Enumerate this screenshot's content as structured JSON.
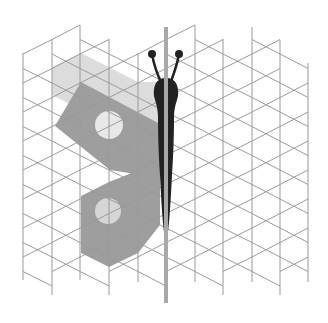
{
  "figure": {
    "title": "Butterfly on triangular grid with mirror line",
    "width": 328,
    "height": 323
  },
  "grid": {
    "columns_x": [
      23,
      52,
      80,
      109,
      138,
      166,
      195,
      223,
      252,
      280,
      308
    ],
    "row_step": 29,
    "stroke": "#9a9a9a"
  },
  "colors": {
    "background": "#ffffff",
    "wing_light": "#dcdcdc",
    "wing_dark": "#9e9e9e",
    "spot": "#e8e8e8",
    "body": "#222222",
    "mirror_line": "#a8a8a8"
  },
  "shapes": {
    "upper_wing_light": "52,67 81,53 138,82 160,82 160,150 52,95",
    "upper_wing_dark": "81,82 160,124 160,178 110,170 55,126",
    "lower_wing": "81,196 109,182 140,170 160,170 160,225 138,253 109,267 81,253",
    "upper_spot": {
      "cx": 109,
      "cy": 125,
      "r": 14
    },
    "lower_spot": {
      "cx": 108,
      "cy": 211,
      "r": 13
    }
  },
  "mirror_line": {
    "x": 166,
    "y1": 27,
    "y2": 303
  },
  "body": {
    "head": {
      "cx": 166,
      "cy": 90,
      "rx": 12,
      "ry": 12
    },
    "antenna_left_tip": {
      "cx": 152,
      "cy": 54,
      "r": 4
    },
    "antenna_right_tip": {
      "cx": 179,
      "cy": 54,
      "r": 4
    }
  }
}
